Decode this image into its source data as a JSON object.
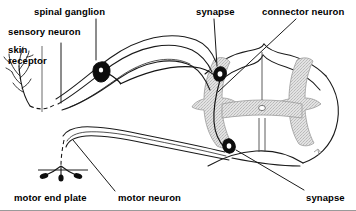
{
  "figure": {
    "background_color": "#ffffff",
    "line_color": "#000000",
    "gray_matter_fill": "#d9d9d9",
    "gray_matter_stipple": "#bdbdbd",
    "width": 356,
    "height": 211
  },
  "labels": {
    "spinal_ganglion": "spinal ganglion",
    "sensory_neuron": "sensory neuron",
    "skin_receptor": "skin\nreceptor",
    "synapse_top": "synapse",
    "connector_neuron": "connector neuron",
    "motor_end_plate": "motor end plate",
    "motor_neuron": "motor neuron",
    "synapse_bottom": "synapse"
  },
  "structures": {
    "spinal_cord": "spinal-cord-cross-section",
    "gray_matter": "gray-matter-butterfly",
    "central_canal": "central-canal",
    "ventral_fissure": "ventral-median-fissure",
    "dorsal_root": "dorsal-root-nerve-bundle",
    "ventral_root": "ventral-root-nerve-bundle",
    "ganglion_cell_body": "spinal-ganglion-cell-body",
    "dorsal_synapse": "dorsal-horn-synapse",
    "ventral_synapse": "ventral-horn-synapse",
    "receptor_dendrites": "skin-receptor-dendrites",
    "end_plate": "motor-end-plate-terminal"
  },
  "leaders": {
    "spinal_ganglion_leader": "leader-line-spinal-ganglion",
    "sensory_neuron_leader": "leader-line-sensory-neuron",
    "skin_receptor_leader": "leader-line-skin-receptor",
    "synapse_top_leader": "leader-line-synapse-top",
    "connector_neuron_leader": "leader-line-connector-neuron",
    "motor_end_plate_leader": "leader-line-motor-end-plate",
    "motor_neuron_leader": "leader-line-motor-neuron",
    "synapse_bottom_leader": "leader-line-synapse-bottom"
  }
}
